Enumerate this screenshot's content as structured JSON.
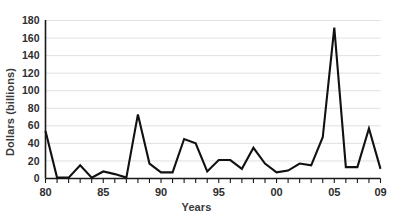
{
  "chart_data": {
    "type": "line",
    "title": "",
    "xlabel": "Years",
    "ylabel": "Dollars (billions)",
    "x": [
      1980,
      1981,
      1982,
      1983,
      1984,
      1985,
      1986,
      1987,
      1988,
      1989,
      1990,
      1991,
      1992,
      1993,
      1994,
      1995,
      1996,
      1997,
      1998,
      1999,
      2000,
      2001,
      2002,
      2003,
      2004,
      2005,
      2006,
      2007,
      2008,
      2009
    ],
    "values": [
      54,
      1,
      1,
      15,
      1,
      8,
      5,
      1,
      73,
      17,
      7,
      7,
      45,
      40,
      8,
      21,
      21,
      11,
      35,
      17,
      7,
      9,
      17,
      15,
      47,
      172,
      13,
      13,
      57,
      11
    ],
    "series": [
      {
        "name": "Dollars (billions)",
        "values": [
          54,
          1,
          1,
          15,
          1,
          8,
          5,
          1,
          73,
          17,
          7,
          7,
          45,
          40,
          8,
          21,
          21,
          11,
          35,
          17,
          7,
          9,
          17,
          15,
          47,
          172,
          13,
          13,
          57,
          11
        ],
        "color": "#111111"
      }
    ],
    "xlim": [
      1980,
      2009
    ],
    "ylim": [
      0,
      180
    ],
    "y_ticks": [
      0,
      20,
      40,
      60,
      80,
      100,
      120,
      140,
      160,
      180
    ],
    "y_tick_labels": [
      "0",
      "20",
      "40",
      "60",
      "80",
      "100",
      "120",
      "140",
      "160",
      "180"
    ],
    "x_ticks": [
      1980,
      1985,
      1990,
      1995,
      2000,
      2005,
      2009
    ],
    "x_tick_labels": [
      "80",
      "85",
      "90",
      "95",
      "00",
      "05",
      "09"
    ],
    "x_minor_ticks": [
      1980,
      1981,
      1982,
      1983,
      1984,
      1985,
      1986,
      1987,
      1988,
      1989,
      1990,
      1991,
      1992,
      1993,
      1994,
      1995,
      1996,
      1997,
      1998,
      1999,
      2000,
      2001,
      2002,
      2003,
      2004,
      2005,
      2006,
      2007,
      2008,
      2009
    ],
    "grid": "horizontal",
    "legend": "none",
    "annotations": []
  },
  "axes": {
    "y_title": "Dollars (billions)",
    "x_title": "Years"
  },
  "colors": {
    "line": "#111111",
    "grid": "#d8d8d8",
    "axis": "#1a1a1a",
    "text": "#2e2e2e",
    "background": "#ffffff"
  }
}
